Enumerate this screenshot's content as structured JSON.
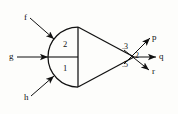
{
  "figure": {
    "background_color": "#fdfdfb",
    "stroke_color": "#111111"
  },
  "inputs": [
    {
      "label": "f",
      "x": 24,
      "y": 13
    },
    {
      "label": "g",
      "x": 9,
      "y": 52
    },
    {
      "label": "h",
      "x": 24,
      "y": 93
    }
  ],
  "regions": [
    {
      "label": "2",
      "x": 63,
      "y": 40
    },
    {
      "label": "1",
      "x": 63,
      "y": 64
    }
  ],
  "outputs": [
    {
      "label": "p",
      "value": ".3",
      "x": 152,
      "y": 33,
      "value_x": 122,
      "value_y": 43
    },
    {
      "label": "q",
      "value": ".2",
      "x": 159,
      "y": 52,
      "value_x": 133,
      "value_y": 52
    },
    {
      "label": "r",
      "value": ".5",
      "x": 152,
      "y": 67,
      "value_x": 122,
      "value_y": 61
    }
  ]
}
